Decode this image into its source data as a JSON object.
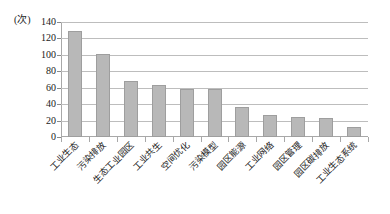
{
  "chart_data": {
    "type": "bar",
    "title": "",
    "subtitle": "",
    "xlabel": "",
    "ylabel": "(次)",
    "unit_label": "(次)",
    "ylim": [
      0,
      140
    ],
    "ytick_step": 20,
    "ytick_labels": [
      "0",
      "20",
      "40",
      "60",
      "80",
      "100",
      "120",
      "140"
    ],
    "grid": true,
    "legend": "none",
    "bar_color": "#b8b8b8",
    "bar_border_color": "#9e9e9e",
    "axis_color": "#a8a8a8",
    "grid_color": "#bdbdbd",
    "categories": [
      "工业生态",
      "污染排放",
      "生态工业园区",
      "工业共生",
      "空间优化",
      "污染模型",
      "园区能源",
      "工业网络",
      "园区管理",
      "园区碳排放",
      "工业生态系统"
    ],
    "values": [
      129,
      101,
      68,
      63,
      58,
      58,
      37,
      27,
      24,
      23,
      12
    ],
    "series": [
      {
        "name": "频次",
        "values": [
          129,
          101,
          68,
          63,
          58,
          58,
          37,
          27,
          24,
          23,
          12
        ]
      }
    ]
  }
}
